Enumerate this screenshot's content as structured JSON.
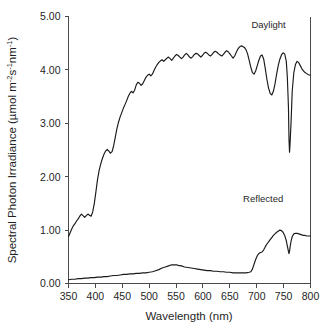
{
  "chart_data": {
    "type": "line",
    "title": "",
    "xlabel": "Wavelength (nm)",
    "ylabel_parts": {
      "main": "Spectral Photon Irradiance (µmol m",
      "sup1": "-2",
      "mid1": "s",
      "sup2": "-1",
      "mid2": "nm",
      "sup3": "-1",
      "tail": ")"
    },
    "ylabel": "Spectral Photon Irradiance (µmol m-2s-1nm-1)",
    "xlim": [
      350,
      800
    ],
    "ylim": [
      0.0,
      5.0
    ],
    "xticks": [
      350,
      400,
      450,
      500,
      550,
      600,
      650,
      700,
      750,
      800
    ],
    "xtick_labels": [
      "350",
      "400",
      "450",
      "500",
      "550",
      "600",
      "650",
      "700",
      "750",
      "800"
    ],
    "yticks": [
      0.0,
      1.0,
      2.0,
      3.0,
      4.0,
      5.0
    ],
    "ytick_labels": [
      "0.00",
      "1.00",
      "2.00",
      "3.00",
      "4.00",
      "5.00"
    ],
    "grid": false,
    "legend_position": "inline-annotation",
    "line_color": "#1a1a1a",
    "axis_color": "#4a4a4a",
    "background_color": "#ffffff",
    "annotations": [
      {
        "text": "Daylight",
        "x": 722,
        "y": 4.78
      },
      {
        "text": "Reflected",
        "x": 712,
        "y": 1.52
      }
    ],
    "series": [
      {
        "name": "Daylight",
        "label": "Daylight",
        "x": [
          350,
          353,
          356,
          359,
          362,
          365,
          368,
          371,
          374,
          377,
          380,
          383,
          386,
          389,
          392,
          395,
          398,
          401,
          404,
          407,
          410,
          413,
          416,
          419,
          422,
          425,
          428,
          431,
          434,
          437,
          440,
          443,
          446,
          449,
          452,
          455,
          458,
          461,
          464,
          467,
          470,
          473,
          476,
          479,
          482,
          485,
          488,
          491,
          494,
          497,
          500,
          503,
          506,
          509,
          512,
          515,
          518,
          521,
          524,
          527,
          530,
          533,
          536,
          539,
          542,
          545,
          548,
          551,
          554,
          557,
          560,
          563,
          566,
          569,
          572,
          575,
          578,
          581,
          584,
          587,
          590,
          593,
          596,
          599,
          602,
          605,
          608,
          611,
          614,
          617,
          620,
          623,
          626,
          629,
          632,
          635,
          638,
          641,
          644,
          647,
          650,
          653,
          656,
          659,
          662,
          665,
          668,
          671,
          674,
          677,
          680,
          683,
          686,
          689,
          692,
          695,
          698,
          701,
          704,
          707,
          710,
          713,
          716,
          719,
          722,
          725,
          728,
          731,
          734,
          737,
          740,
          743,
          746,
          749,
          752,
          755,
          757,
          759,
          760,
          761,
          762,
          764,
          766,
          769,
          772,
          775,
          778,
          781,
          784,
          787,
          790,
          793,
          796,
          800
        ],
        "values": [
          0.88,
          0.95,
          1.02,
          1.08,
          1.12,
          1.17,
          1.21,
          1.26,
          1.3,
          1.27,
          1.24,
          1.27,
          1.3,
          1.28,
          1.26,
          1.34,
          1.5,
          1.72,
          1.95,
          2.12,
          2.24,
          2.34,
          2.42,
          2.48,
          2.51,
          2.48,
          2.44,
          2.47,
          2.58,
          2.74,
          2.9,
          3.02,
          3.12,
          3.2,
          3.28,
          3.35,
          3.42,
          3.5,
          3.56,
          3.6,
          3.57,
          3.62,
          3.72,
          3.77,
          3.75,
          3.71,
          3.74,
          3.8,
          3.86,
          3.9,
          3.92,
          3.89,
          3.92,
          3.99,
          4.05,
          4.1,
          4.14,
          4.17,
          4.19,
          4.16,
          4.19,
          4.22,
          4.24,
          4.21,
          4.18,
          4.22,
          4.26,
          4.29,
          4.27,
          4.24,
          4.21,
          4.24,
          4.28,
          4.31,
          4.28,
          4.24,
          4.22,
          4.25,
          4.29,
          4.31,
          4.3,
          4.27,
          4.24,
          4.27,
          4.31,
          4.33,
          4.31,
          4.28,
          4.26,
          4.29,
          4.33,
          4.35,
          4.33,
          4.3,
          4.28,
          4.26,
          4.29,
          4.33,
          4.36,
          4.34,
          4.3,
          4.26,
          4.22,
          4.26,
          4.33,
          4.39,
          4.43,
          4.45,
          4.44,
          4.42,
          4.38,
          4.3,
          4.18,
          4.05,
          3.95,
          3.92,
          3.98,
          4.08,
          4.18,
          4.26,
          4.28,
          4.2,
          4.02,
          3.82,
          3.66,
          3.56,
          3.53,
          3.6,
          3.74,
          3.92,
          4.08,
          4.2,
          4.28,
          4.32,
          4.3,
          4.16,
          3.85,
          3.3,
          2.7,
          2.46,
          2.62,
          3.05,
          3.6,
          3.95,
          4.1,
          4.16,
          4.14,
          4.08,
          4.02,
          3.98,
          3.95,
          3.93,
          3.91,
          3.9
        ]
      },
      {
        "name": "Reflected",
        "label": "Reflected",
        "x": [
          350,
          356,
          362,
          368,
          374,
          380,
          386,
          392,
          398,
          404,
          410,
          416,
          422,
          428,
          434,
          440,
          446,
          452,
          458,
          464,
          470,
          476,
          482,
          488,
          494,
          500,
          506,
          512,
          518,
          524,
          530,
          536,
          542,
          548,
          551,
          554,
          560,
          566,
          572,
          578,
          584,
          590,
          596,
          602,
          608,
          614,
          620,
          626,
          632,
          638,
          644,
          650,
          656,
          662,
          668,
          674,
          680,
          686,
          689,
          692,
          695,
          698,
          701,
          704,
          707,
          710,
          713,
          716,
          719,
          722,
          725,
          728,
          731,
          734,
          737,
          740,
          743,
          746,
          749,
          752,
          755,
          757,
          759,
          760,
          761,
          762,
          764,
          766,
          769,
          772,
          775,
          778,
          781,
          784,
          787,
          790,
          793,
          796,
          800
        ],
        "values": [
          0.07,
          0.08,
          0.08,
          0.09,
          0.09,
          0.1,
          0.1,
          0.11,
          0.11,
          0.12,
          0.12,
          0.13,
          0.13,
          0.14,
          0.15,
          0.15,
          0.16,
          0.17,
          0.17,
          0.18,
          0.18,
          0.19,
          0.19,
          0.2,
          0.2,
          0.21,
          0.22,
          0.24,
          0.26,
          0.29,
          0.31,
          0.33,
          0.35,
          0.35,
          0.35,
          0.34,
          0.33,
          0.31,
          0.3,
          0.29,
          0.28,
          0.27,
          0.26,
          0.25,
          0.24,
          0.24,
          0.23,
          0.23,
          0.22,
          0.22,
          0.21,
          0.21,
          0.2,
          0.2,
          0.2,
          0.2,
          0.2,
          0.21,
          0.22,
          0.27,
          0.36,
          0.45,
          0.52,
          0.56,
          0.58,
          0.59,
          0.63,
          0.69,
          0.74,
          0.78,
          0.82,
          0.86,
          0.9,
          0.93,
          0.96,
          0.98,
          1.0,
          0.99,
          0.96,
          0.9,
          0.8,
          0.7,
          0.6,
          0.56,
          0.6,
          0.68,
          0.8,
          0.88,
          0.93,
          0.94,
          0.94,
          0.93,
          0.92,
          0.91,
          0.9,
          0.9,
          0.89,
          0.89,
          0.89
        ]
      }
    ]
  }
}
